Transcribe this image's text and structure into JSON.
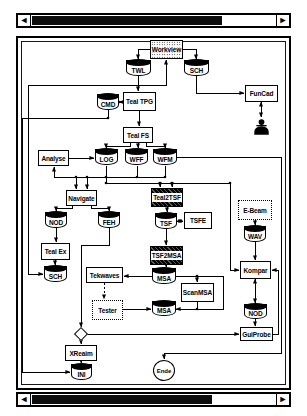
{
  "window": {
    "bg": "#ffffff",
    "stroke": "#000000",
    "scrollbars": {
      "left_arrow": "◄",
      "right_arrow": "►",
      "top_thumb_pct": 78,
      "bottom_thumb_pct": 74
    }
  },
  "diagram": {
    "node_fill": "#ffffff",
    "line_color": "#000000",
    "nodes": [
      {
        "id": "workview",
        "label": "Workview",
        "type": "stipple",
        "x": 150,
        "y": 40,
        "w": 33,
        "h": 19
      },
      {
        "id": "twl",
        "label": "TWL",
        "type": "cyl",
        "x": 126,
        "y": 60,
        "w": 25,
        "h": 16
      },
      {
        "id": "sch-top",
        "label": "SCH",
        "type": "cyl",
        "x": 184,
        "y": 60,
        "w": 25,
        "h": 16
      },
      {
        "id": "funcad",
        "label": "FunCad",
        "type": "box",
        "x": 245,
        "y": 85,
        "w": 33,
        "h": 17
      },
      {
        "id": "user",
        "label": "",
        "type": "user",
        "x": 253,
        "y": 118,
        "w": 17,
        "h": 18
      },
      {
        "id": "cmd",
        "label": "CMD",
        "type": "cyl",
        "x": 97,
        "y": 94,
        "w": 22,
        "h": 16
      },
      {
        "id": "teal-tpg",
        "label": "Teal TPG",
        "type": "box",
        "x": 123,
        "y": 92,
        "w": 33,
        "h": 19
      },
      {
        "id": "teal-fs",
        "label": "Teal FS",
        "type": "box",
        "x": 123,
        "y": 127,
        "w": 30,
        "h": 16
      },
      {
        "id": "analyse",
        "label": "Analyse",
        "type": "box",
        "x": 38,
        "y": 150,
        "w": 31,
        "h": 16
      },
      {
        "id": "log",
        "label": "LOG",
        "type": "cyl",
        "x": 95,
        "y": 149,
        "w": 23,
        "h": 16
      },
      {
        "id": "wff",
        "label": "WFF",
        "type": "cyl",
        "x": 125,
        "y": 149,
        "w": 23,
        "h": 16
      },
      {
        "id": "wfm",
        "label": "WFM",
        "type": "cyl",
        "x": 153,
        "y": 149,
        "w": 24,
        "h": 16
      },
      {
        "id": "navigate",
        "label": "Navigate",
        "type": "box",
        "x": 66,
        "y": 190,
        "w": 31,
        "h": 16
      },
      {
        "id": "teal2tsf",
        "label": "Teal2TSF",
        "type": "stripe",
        "x": 151,
        "y": 188,
        "w": 32,
        "h": 19
      },
      {
        "id": "nod-left",
        "label": "NOD",
        "type": "cyl",
        "x": 45,
        "y": 212,
        "w": 22,
        "h": 16
      },
      {
        "id": "feh",
        "label": "FEH",
        "type": "cyl",
        "x": 98,
        "y": 212,
        "w": 22,
        "h": 16
      },
      {
        "id": "tsf",
        "label": "TSF",
        "type": "cyl",
        "x": 155,
        "y": 213,
        "w": 22,
        "h": 16
      },
      {
        "id": "tsfe",
        "label": "TSFE",
        "type": "box",
        "x": 184,
        "y": 212,
        "w": 28,
        "h": 17
      },
      {
        "id": "teal-ex",
        "label": "Teal Ex",
        "type": "box",
        "x": 41,
        "y": 243,
        "w": 29,
        "h": 17
      },
      {
        "id": "sch-left",
        "label": "SCH",
        "type": "cyl",
        "x": 44,
        "y": 266,
        "w": 23,
        "h": 16
      },
      {
        "id": "tsf2msa",
        "label": "TSF2MSA",
        "type": "stripe",
        "x": 150,
        "y": 246,
        "w": 33,
        "h": 19
      },
      {
        "id": "e-beam",
        "label": "E-Beam",
        "type": "dotted",
        "x": 238,
        "y": 200,
        "w": 34,
        "h": 20
      },
      {
        "id": "wav",
        "label": "WAV",
        "type": "cyl",
        "x": 244,
        "y": 226,
        "w": 22,
        "h": 16
      },
      {
        "id": "tekwaves",
        "label": "Tekwaves",
        "type": "box",
        "x": 86,
        "y": 267,
        "w": 37,
        "h": 16
      },
      {
        "id": "msa-1",
        "label": "MSA",
        "type": "cyl",
        "x": 152,
        "y": 268,
        "w": 24,
        "h": 16
      },
      {
        "id": "scanmsa",
        "label": "ScanMSA",
        "type": "box",
        "x": 181,
        "y": 283,
        "w": 33,
        "h": 19
      },
      {
        "id": "kompar",
        "label": "Kompar",
        "type": "box",
        "x": 240,
        "y": 261,
        "w": 31,
        "h": 18
      },
      {
        "id": "tester",
        "label": "Tester",
        "type": "dotted",
        "x": 92,
        "y": 300,
        "w": 31,
        "h": 20
      },
      {
        "id": "msa-2",
        "label": "MSA",
        "type": "cyl",
        "x": 152,
        "y": 301,
        "w": 24,
        "h": 15
      },
      {
        "id": "nod-right",
        "label": "NOD",
        "type": "cyl",
        "x": 244,
        "y": 304,
        "w": 23,
        "h": 15
      },
      {
        "id": "guiprobe",
        "label": "GuiProbe",
        "type": "box",
        "x": 240,
        "y": 327,
        "w": 33,
        "h": 14
      },
      {
        "id": "diamond",
        "label": "",
        "type": "diamond",
        "x": 75,
        "y": 328,
        "w": 12,
        "h": 12
      },
      {
        "id": "xreaim",
        "label": "XReaim",
        "type": "box",
        "x": 65,
        "y": 345,
        "w": 32,
        "h": 16
      },
      {
        "id": "ini",
        "label": "INI",
        "type": "cyl",
        "x": 71,
        "y": 364,
        "w": 21,
        "h": 16
      },
      {
        "id": "ende",
        "label": "Ende",
        "type": "circle",
        "x": 153,
        "y": 360,
        "w": 22,
        "h": 21
      }
    ],
    "edges": [
      {
        "points": [
          [
            150,
            49
          ],
          [
            138,
            49
          ],
          [
            138,
            59
          ]
        ],
        "arrow": "end"
      },
      {
        "points": [
          [
            183,
            49
          ],
          [
            196,
            49
          ],
          [
            196,
            59
          ]
        ],
        "arrow": "end"
      },
      {
        "points": [
          [
            138,
            76
          ],
          [
            138,
            91
          ]
        ],
        "arrow": "end"
      },
      {
        "points": [
          [
            28,
            274
          ],
          [
            43,
            274
          ]
        ],
        "arrow": "end"
      },
      {
        "points": [
          [
            28,
            274
          ],
          [
            28,
            85
          ],
          [
            166,
            85
          ],
          [
            166,
            60
          ]
        ],
        "arrow": "end"
      },
      {
        "points": [
          [
            196,
            76
          ],
          [
            196,
            93
          ],
          [
            244,
            93
          ]
        ],
        "arrow": "end"
      },
      {
        "points": [
          [
            261,
            102
          ],
          [
            261,
            117
          ]
        ],
        "arrow": "both"
      },
      {
        "points": [
          [
            119,
            102
          ],
          [
            122,
            102
          ]
        ],
        "arrow": "both"
      },
      {
        "points": [
          [
            139,
            111
          ],
          [
            139,
            126
          ]
        ],
        "arrow": "end"
      },
      {
        "points": [
          [
            108,
            110
          ],
          [
            108,
            118
          ],
          [
            22,
            118
          ],
          [
            22,
            372
          ],
          [
            70,
            372
          ]
        ],
        "arrow": "end"
      },
      {
        "points": [
          [
            130,
            143
          ],
          [
            130,
            146
          ],
          [
            106,
            146
          ],
          [
            106,
            148
          ]
        ],
        "arrow": "end"
      },
      {
        "points": [
          [
            138,
            143
          ],
          [
            138,
            148
          ]
        ],
        "arrow": "end"
      },
      {
        "points": [
          [
            146,
            143
          ],
          [
            146,
            146
          ],
          [
            165,
            146
          ],
          [
            165,
            148
          ]
        ],
        "arrow": "end"
      },
      {
        "points": [
          [
            69,
            158
          ],
          [
            94,
            158
          ]
        ],
        "arrow": "end"
      },
      {
        "points": [
          [
            54,
            177
          ],
          [
            165,
            177
          ]
        ],
        "arrow": "none"
      },
      {
        "points": [
          [
            54,
            177
          ],
          [
            54,
            167
          ]
        ],
        "arrow": "end"
      },
      {
        "points": [
          [
            106,
            166
          ],
          [
            106,
            177
          ]
        ],
        "arrow": "none"
      },
      {
        "points": [
          [
            137,
            166
          ],
          [
            137,
            177
          ]
        ],
        "arrow": "none"
      },
      {
        "points": [
          [
            165,
            166
          ],
          [
            165,
            177
          ]
        ],
        "arrow": "none"
      },
      {
        "points": [
          [
            76,
            177
          ],
          [
            76,
            189
          ]
        ],
        "arrow": "end"
      },
      {
        "points": [
          [
            87,
            177
          ],
          [
            87,
            189
          ]
        ],
        "arrow": "end"
      },
      {
        "points": [
          [
            106,
            177
          ],
          [
            106,
            183
          ],
          [
            230,
            183
          ],
          [
            230,
            270
          ],
          [
            239,
            270
          ]
        ],
        "arrow": "end"
      },
      {
        "points": [
          [
            160,
            183
          ],
          [
            160,
            187
          ]
        ],
        "arrow": "end"
      },
      {
        "points": [
          [
            172,
            183
          ],
          [
            172,
            187
          ]
        ],
        "arrow": "end"
      },
      {
        "points": [
          [
            167,
            207
          ],
          [
            167,
            212
          ]
        ],
        "arrow": "end"
      },
      {
        "points": [
          [
            177,
            221
          ],
          [
            183,
            221
          ]
        ],
        "arrow": "both"
      },
      {
        "points": [
          [
            166,
            229
          ],
          [
            166,
            245
          ]
        ],
        "arrow": "end"
      },
      {
        "points": [
          [
            166,
            265
          ],
          [
            166,
            267
          ]
        ],
        "arrow": "end"
      },
      {
        "points": [
          [
            152,
            276
          ],
          [
            124,
            276
          ]
        ],
        "arrow": "end"
      },
      {
        "points": [
          [
            104,
            283
          ],
          [
            104,
            299
          ]
        ],
        "arrow": "end",
        "dashed": true
      },
      {
        "points": [
          [
            123,
            309
          ],
          [
            151,
            309
          ]
        ],
        "arrow": "end"
      },
      {
        "points": [
          [
            176,
            276
          ],
          [
            223,
            276
          ],
          [
            223,
            309
          ],
          [
            176,
            309
          ]
        ],
        "arrow": "end"
      },
      {
        "points": [
          [
            197,
            276
          ],
          [
            197,
            282
          ]
        ],
        "arrow": "end"
      },
      {
        "points": [
          [
            197,
            302
          ],
          [
            197,
            309
          ]
        ],
        "arrow": "none"
      },
      {
        "points": [
          [
            255,
            220
          ],
          [
            255,
            225
          ]
        ],
        "arrow": "end"
      },
      {
        "points": [
          [
            255,
            242
          ],
          [
            255,
            260
          ]
        ],
        "arrow": "end"
      },
      {
        "points": [
          [
            255,
            279
          ],
          [
            255,
            303
          ]
        ],
        "arrow": "both"
      },
      {
        "points": [
          [
            255,
            319
          ],
          [
            255,
            326
          ]
        ],
        "arrow": "end"
      },
      {
        "points": [
          [
            87,
            334
          ],
          [
            239,
            334
          ]
        ],
        "arrow": "end"
      },
      {
        "points": [
          [
            273,
            334
          ],
          [
            278,
            334
          ],
          [
            278,
            270
          ],
          [
            272,
            270
          ]
        ],
        "arrow": "end"
      },
      {
        "points": [
          [
            109,
            228
          ],
          [
            109,
            245
          ],
          [
            81,
            245
          ],
          [
            81,
            327
          ]
        ],
        "arrow": "end"
      },
      {
        "points": [
          [
            81,
            340
          ],
          [
            81,
            344
          ]
        ],
        "arrow": "end"
      },
      {
        "points": [
          [
            81,
            361
          ],
          [
            81,
            363
          ]
        ],
        "arrow": "end"
      },
      {
        "points": [
          [
            72,
            206
          ],
          [
            72,
            208
          ],
          [
            56,
            208
          ],
          [
            56,
            211
          ]
        ],
        "arrow": "end"
      },
      {
        "points": [
          [
            91,
            206
          ],
          [
            91,
            208
          ],
          [
            109,
            208
          ],
          [
            109,
            211
          ]
        ],
        "arrow": "end"
      },
      {
        "points": [
          [
            56,
            228
          ],
          [
            56,
            242
          ]
        ],
        "arrow": "end"
      },
      {
        "points": [
          [
            55,
            260
          ],
          [
            55,
            265
          ]
        ],
        "arrow": "end"
      },
      {
        "points": [
          [
            177,
            157
          ],
          [
            281,
            157
          ],
          [
            281,
            353
          ],
          [
            164,
            353
          ],
          [
            164,
            359
          ]
        ],
        "arrow": "end"
      }
    ],
    "dots": [
      [
        108,
        118
      ],
      [
        76,
        177
      ],
      [
        87,
        177
      ],
      [
        106,
        177
      ],
      [
        137,
        177
      ],
      [
        165,
        177
      ],
      [
        106,
        183
      ],
      [
        160,
        183
      ],
      [
        172,
        183
      ],
      [
        197,
        276
      ],
      [
        197,
        309
      ],
      [
        230,
        183
      ]
    ]
  }
}
